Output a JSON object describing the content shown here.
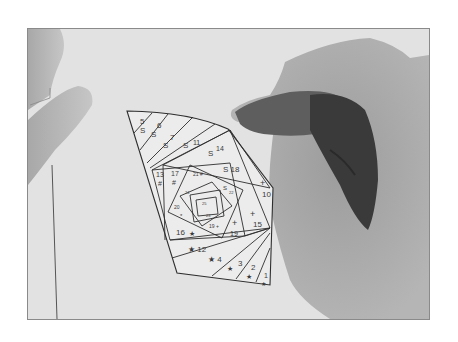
{
  "photo": {
    "description": "Grayscale photo of hands holding a cut-out iris-folding paper pattern",
    "frame": {
      "x": 27,
      "y": 28,
      "width": 403,
      "height": 292,
      "border_color": "#8a8a8a"
    },
    "colors": {
      "background": "#e4e4e4",
      "paper": "#ececec",
      "lines": "#2e2e2e",
      "hand_light": "#b8b8b8",
      "hand_mid": "#9a9a9a",
      "hand_dark": "#3a3a3a"
    }
  },
  "pattern": {
    "labels": [
      {
        "text": "5",
        "x": 140,
        "y": 124,
        "size": 8
      },
      {
        "text": "S",
        "x": 140,
        "y": 133,
        "size": 8
      },
      {
        "text": "6",
        "x": 157,
        "y": 128,
        "size": 8
      },
      {
        "text": "S",
        "x": 151,
        "y": 137,
        "size": 8
      },
      {
        "text": "7",
        "x": 170,
        "y": 140,
        "size": 8
      },
      {
        "text": "S",
        "x": 163,
        "y": 148,
        "size": 8
      },
      {
        "text": "S",
        "x": 183,
        "y": 148,
        "size": 8
      },
      {
        "text": "11",
        "x": 193,
        "y": 145,
        "size": 7
      },
      {
        "text": "S",
        "x": 208,
        "y": 156,
        "size": 8
      },
      {
        "text": "14",
        "x": 216,
        "y": 151,
        "size": 7
      },
      {
        "text": "13",
        "x": 156,
        "y": 177,
        "size": 7
      },
      {
        "text": "#",
        "x": 158,
        "y": 186,
        "size": 7
      },
      {
        "text": "17",
        "x": 171,
        "y": 176,
        "size": 7
      },
      {
        "text": "#",
        "x": 172,
        "y": 185,
        "size": 7
      },
      {
        "text": "S 18",
        "x": 223,
        "y": 172,
        "size": 8
      },
      {
        "text": "21 #",
        "x": 193,
        "y": 176,
        "size": 5
      },
      {
        "text": "S",
        "x": 223,
        "y": 190,
        "size": 6
      },
      {
        "text": "22",
        "x": 229,
        "y": 194,
        "size": 4
      },
      {
        "text": "24",
        "x": 185,
        "y": 194,
        "size": 4
      },
      {
        "text": "25",
        "x": 202,
        "y": 205,
        "size": 4
      },
      {
        "text": "20",
        "x": 174,
        "y": 209,
        "size": 5
      },
      {
        "text": "*",
        "x": 180,
        "y": 218,
        "size": 6
      },
      {
        "text": "23",
        "x": 206,
        "y": 217,
        "size": 4
      },
      {
        "text": "19 +",
        "x": 209,
        "y": 228,
        "size": 5
      },
      {
        "text": "+",
        "x": 260,
        "y": 186,
        "size": 9
      },
      {
        "text": "10",
        "x": 262,
        "y": 197,
        "size": 8
      },
      {
        "text": "+",
        "x": 250,
        "y": 217,
        "size": 9
      },
      {
        "text": "15",
        "x": 253,
        "y": 227,
        "size": 8
      },
      {
        "text": "+",
        "x": 232,
        "y": 226,
        "size": 9
      },
      {
        "text": "19",
        "x": 230,
        "y": 236,
        "size": 7
      },
      {
        "text": "16",
        "x": 176,
        "y": 235,
        "size": 8
      },
      {
        "text": "★",
        "x": 189,
        "y": 236,
        "size": 7
      },
      {
        "text": "★ 12",
        "x": 188,
        "y": 252,
        "size": 8
      },
      {
        "text": "★ 4",
        "x": 208,
        "y": 262,
        "size": 8
      },
      {
        "text": "★",
        "x": 227,
        "y": 271,
        "size": 7
      },
      {
        "text": "3",
        "x": 238,
        "y": 266,
        "size": 8
      },
      {
        "text": "2",
        "x": 251,
        "y": 270,
        "size": 8
      },
      {
        "text": "★",
        "x": 246,
        "y": 279,
        "size": 7
      },
      {
        "text": "1",
        "x": 264,
        "y": 278,
        "size": 7
      },
      {
        "text": "★",
        "x": 261,
        "y": 286,
        "size": 6
      }
    ]
  }
}
